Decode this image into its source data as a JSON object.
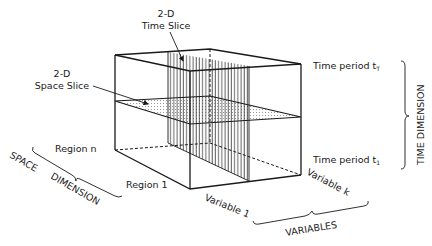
{
  "diagram": {
    "type": "3d-data-cube",
    "labels": {
      "time_slice": {
        "line1": "2-D",
        "line2": "Time Slice"
      },
      "space_slice": {
        "line1": "2-D",
        "line2": "Space Slice"
      },
      "time_period_top": "Time period t",
      "time_period_top_sub": "T",
      "time_period_bottom": "Time period t",
      "time_period_bottom_sub": "1",
      "time_dimension": "TIME   DIMENSION",
      "region_n": "Region  n",
      "region_1": "Region  1",
      "space_dimension_1": "SPACE",
      "space_dimension_2": "DIMENSION",
      "variable_1": "Variable  1",
      "variable_k": "Variable  k",
      "variables": "VARIABLES"
    },
    "colors": {
      "line": "#1a1a1a",
      "background": "#ffffff"
    }
  }
}
